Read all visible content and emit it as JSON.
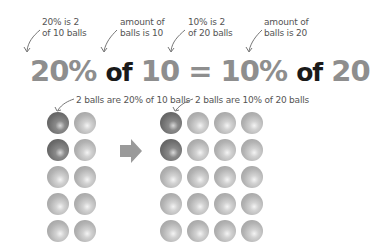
{
  "annotations": {
    "left_pct_note": [
      "20% is 2",
      "of 10 balls"
    ],
    "left_amount_note": [
      "amount of",
      "balls is 10"
    ],
    "right_pct_note": [
      "10% is 2",
      "of 20 balls"
    ],
    "right_amount_note": [
      "amount of",
      "balls is 20"
    ],
    "left_group_note": "2 balls are 20% of 10 balls",
    "right_group_note": "2 balls are 10% of 20 balls"
  },
  "equation": {
    "left_percent": "20%",
    "of1": "of",
    "left_amount": "10",
    "equals": "=",
    "right_percent": "10%",
    "of2": "of",
    "right_amount": "20"
  },
  "groups": {
    "left": {
      "total_balls": 10,
      "highlighted_balls": 2,
      "columns": 2,
      "rows": 5
    },
    "right": {
      "total_balls": 20,
      "highlighted_balls": 2,
      "columns": 4,
      "rows": 5
    }
  },
  "colors": {
    "number_gray": "#8e8e8e",
    "text_dark": "#1a1a1a",
    "ball_light": "#b3b3b3",
    "ball_dark": "#6c6c6c",
    "arrow_gray": "#9a9a9a"
  }
}
